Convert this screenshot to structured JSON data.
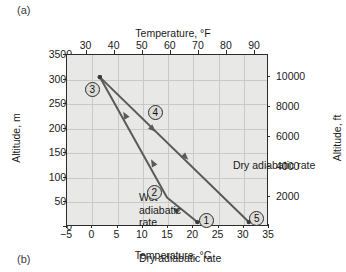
{
  "panels": {
    "a": "(a)",
    "b": "(b)"
  },
  "axes": {
    "top": {
      "title": "Temperature, °F",
      "ticks": [
        30,
        40,
        50,
        60,
        70,
        80,
        90
      ],
      "range": [
        23,
        95
      ]
    },
    "bottom": {
      "title": "Temperature, °C",
      "ticks": [
        -5,
        0,
        5,
        10,
        15,
        20,
        25,
        30,
        35
      ],
      "range": [
        -5,
        35
      ]
    },
    "left": {
      "title": "Altitude, m",
      "ticks": [
        0,
        500,
        1000,
        1500,
        2000,
        2500,
        3000,
        3500
      ],
      "range": [
        0,
        3500
      ]
    },
    "right": {
      "title": "Altitude, ft",
      "ticks": [
        2000,
        4000,
        6000,
        8000,
        10000
      ],
      "range": [
        0,
        11483
      ]
    }
  },
  "annotations": {
    "wet_label": [
      "Wet",
      "adiabatic",
      "rate"
    ],
    "dry_label_lower": "Dry adiabatic rate",
    "dry_label_upper": "Dry adiabatic rate"
  },
  "markers": [
    {
      "id": "1",
      "label": "1",
      "x_c": 22.6,
      "y_m": 130
    },
    {
      "id": "2",
      "label": "2",
      "x_c": 12.3,
      "y_m": 700
    },
    {
      "id": "3",
      "label": "3",
      "x_c": 0.0,
      "y_m": 2790
    },
    {
      "id": "4",
      "label": "4",
      "x_c": 12.5,
      "y_m": 2330
    },
    {
      "id": "5",
      "label": "5",
      "x_c": 32.6,
      "y_m": 170
    }
  ],
  "chart_data": {
    "type": "line",
    "title": "",
    "xlabel": "Temperature, °C",
    "ylabel": "Altitude, m",
    "xlabel_secondary": "Temperature, °F",
    "ylabel_secondary": "Altitude, ft",
    "xlim": [
      -5,
      35
    ],
    "ylim": [
      0,
      3500
    ],
    "xlim_secondary": [
      23,
      95
    ],
    "ylim_secondary": [
      0,
      11483
    ],
    "grid": true,
    "legend": "none",
    "background": "#e8e8e6",
    "series": [
      {
        "name": "Wet adiabatic rate",
        "points": [
          [
            1.5,
            3050
          ],
          [
            14.8,
            600
          ],
          [
            20.8,
            100
          ]
        ],
        "arrow_direction": "up-left",
        "arrows_at": [
          [
            6.5,
            2280
          ],
          [
            12.0,
            1310
          ],
          [
            16.5,
            350
          ]
        ]
      },
      {
        "name": "Dry adiabatic rate",
        "points": [
          [
            1.5,
            3050
          ],
          [
            31.0,
            100
          ]
        ],
        "arrow_direction": "down-right",
        "arrows_at": [
          [
            12.0,
            1990
          ],
          [
            18.5,
            1420
          ]
        ]
      }
    ]
  },
  "colors": {
    "plot_background": "#e8e8e6",
    "grid": "#c9c9c5",
    "axis": "#2b2b2b",
    "line": "#5a5a5a",
    "marker_fill": "#dcdcd8",
    "text": "#1a1a1a"
  }
}
